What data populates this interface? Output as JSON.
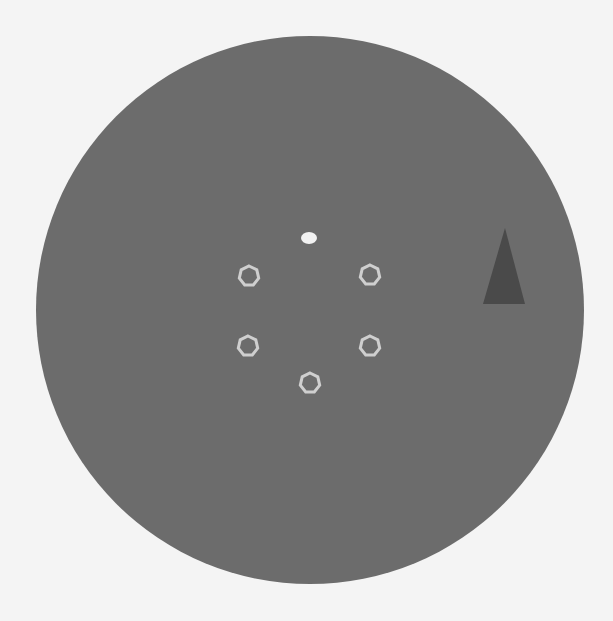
{
  "scene": {
    "background_color": "#f4f4f4",
    "arena": {
      "shape": "circle",
      "cx": 310,
      "cy": 310,
      "r": 274,
      "color": "#6c6c6c"
    },
    "player": {
      "name": "white-blob",
      "x": 309,
      "y": 238,
      "color": "#f2f2f2"
    },
    "targets": [
      {
        "x": 249,
        "y": 276
      },
      {
        "x": 370,
        "y": 275
      },
      {
        "x": 248,
        "y": 346
      },
      {
        "x": 370,
        "y": 346
      },
      {
        "x": 310,
        "y": 383
      }
    ],
    "target_style": {
      "radius": 10,
      "stroke": "#cfcfcf",
      "stroke_width": 3
    },
    "marker": {
      "shape": "triangle",
      "points": "505,228 483,304 525,304",
      "color": "#4a4a4a"
    }
  }
}
